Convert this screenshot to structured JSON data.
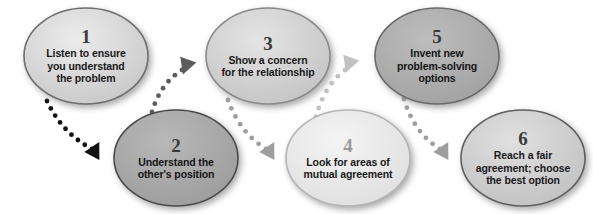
{
  "diagram": {
    "type": "zigzag-process-flow",
    "background_color": "#ffffff",
    "nodes": [
      {
        "id": "node-1",
        "number": "1",
        "text": "Listen to ensure you understand the problem",
        "lines": [
          "Listen to ensure",
          "you understand",
          "the problem"
        ],
        "row": "top",
        "cx": 86,
        "cy": 56,
        "rx": 62,
        "ry": 48,
        "fill": "#dcdcdc",
        "fill_dark": "#c2c2c2",
        "stroke": "#6e6e6e",
        "number_color": "#3a3a3a",
        "text_color": "#1a1a1a",
        "font_size": 10.5,
        "number_size": 19
      },
      {
        "id": "node-2",
        "number": "2",
        "text": "Understand the other's position",
        "lines": [
          "Understand the",
          "other's position"
        ],
        "row": "bottom",
        "cx": 176,
        "cy": 158,
        "rx": 62,
        "ry": 48,
        "fill": "#a9a9a9",
        "fill_dark": "#949494",
        "stroke": "#4a4a4a",
        "number_color": "#3a3a3a",
        "text_color": "#141414",
        "font_size": 10.5,
        "number_size": 19
      },
      {
        "id": "node-3",
        "number": "3",
        "text": "Show a concern for the relationship",
        "lines": [
          "Show a concern",
          "for the relationship"
        ],
        "row": "top",
        "cx": 268,
        "cy": 56,
        "rx": 62,
        "ry": 48,
        "fill": "#d6d6d6",
        "fill_dark": "#bcbcbc",
        "stroke": "#8a8a8a",
        "number_color": "#3a3a3a",
        "text_color": "#1a1a1a",
        "font_size": 10.5,
        "number_size": 19
      },
      {
        "id": "node-4",
        "number": "4",
        "text": "Look for areas of mutual agreement",
        "lines": [
          "Look for areas of",
          "mutual agreement"
        ],
        "row": "bottom",
        "cx": 348,
        "cy": 158,
        "rx": 62,
        "ry": 48,
        "fill": "#eaeaea",
        "fill_dark": "#d8d8d8",
        "stroke": "#b4b4b4",
        "number_color": "#9a9a9a",
        "text_color": "#1a1a1a",
        "font_size": 10.5,
        "number_size": 19
      },
      {
        "id": "node-5",
        "number": "5",
        "text": "Invent new problem-solving options",
        "lines": [
          "Invent new",
          "problem-solving",
          "options"
        ],
        "row": "top",
        "cx": 437,
        "cy": 56,
        "rx": 62,
        "ry": 48,
        "fill": "#aeaeae",
        "fill_dark": "#9a9a9a",
        "stroke": "#6a6a6a",
        "number_color": "#3a3a3a",
        "text_color": "#141414",
        "font_size": 10.5,
        "number_size": 19
      },
      {
        "id": "node-6",
        "number": "6",
        "text": "Reach a fair agreement; choose the best option",
        "lines": [
          "Reach a fair",
          "agreement; choose",
          "the best option"
        ],
        "row": "bottom",
        "cx": 523,
        "cy": 158,
        "rx": 62,
        "ry": 48,
        "fill": "#d3d3d3",
        "fill_dark": "#bcbcbc",
        "stroke": "#5e5e5e",
        "number_color": "#3a3a3a",
        "text_color": "#1a1a1a",
        "font_size": 10.5,
        "number_size": 19
      }
    ],
    "connectors": [
      {
        "id": "connector-1-2",
        "from": "node-1",
        "to": "node-2",
        "style": "dotted-curve",
        "color": "#111111",
        "dot_radius": 2.4,
        "path": "M 47 101 Q 62 133 92 149",
        "arrow": {
          "x": 95,
          "y": 150,
          "angle": 28,
          "color": "#111111",
          "size": 9
        }
      },
      {
        "id": "connector-2-3",
        "from": "node-2",
        "to": "node-3",
        "style": "dotted-curve",
        "color": "#5c5c5c",
        "dot_radius": 2.4,
        "path": "M 152 112 Q 160 84 182 70",
        "arrow": {
          "x": 186,
          "y": 66,
          "angle": 200,
          "color": "#5c5c5c",
          "size": 9
        }
      },
      {
        "id": "connector-3-4",
        "from": "node-3",
        "to": "node-4",
        "style": "dotted-curve",
        "color": "#9e9e9e",
        "dot_radius": 2.4,
        "path": "M 228 100 Q 240 133 266 149",
        "arrow": {
          "x": 270,
          "y": 150,
          "angle": 28,
          "color": "#9e9e9e",
          "size": 9
        }
      },
      {
        "id": "connector-4-5",
        "from": "node-4",
        "to": "node-5",
        "style": "dotted-curve",
        "color": "#c2c2c2",
        "dot_radius": 2.4,
        "path": "M 316 117 Q 324 86 345 70",
        "arrow": {
          "x": 349,
          "y": 64,
          "angle": 200,
          "color": "#c2c2c2",
          "size": 9
        }
      },
      {
        "id": "connector-5-6",
        "from": "node-5",
        "to": "node-6",
        "style": "dotted-curve",
        "color": "#9e9e9e",
        "dot_radius": 2.4,
        "path": "M 404 99 Q 414 133 440 149",
        "arrow": {
          "x": 444,
          "y": 150,
          "angle": 28,
          "color": "#9e9e9e",
          "size": 9
        }
      }
    ]
  }
}
